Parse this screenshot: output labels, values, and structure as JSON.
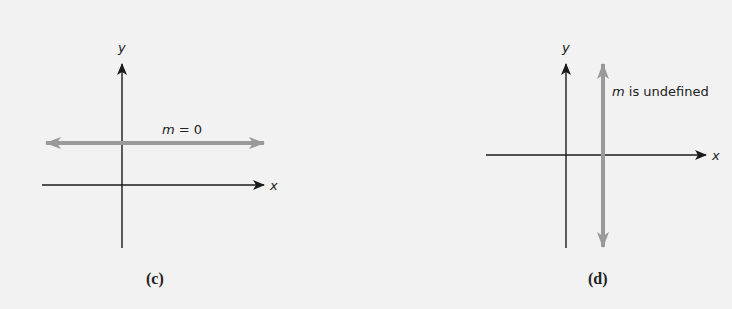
{
  "colors": {
    "background": "#f2f2f2",
    "axis": "#1a1a1a",
    "line": "#9a9a9a"
  },
  "panels": [
    {
      "caption": "(c)",
      "x_label": "x",
      "y_label": "y",
      "line_label_var": "m",
      "line_label_rest": " = 0",
      "line_type": "horizontal"
    },
    {
      "caption": "(d)",
      "x_label": "x",
      "y_label": "y",
      "line_label_var": "m",
      "line_label_rest": " is undefined",
      "line_type": "vertical"
    }
  ]
}
